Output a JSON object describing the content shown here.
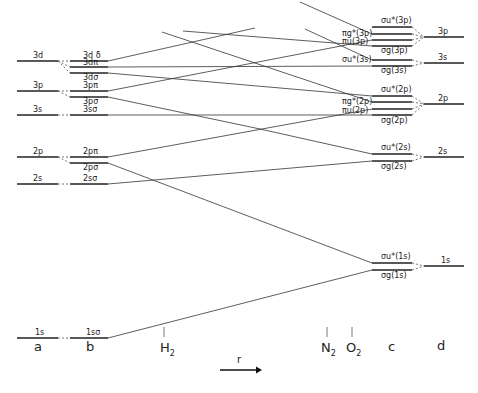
{
  "diagram": {
    "type": "molecular-orbital correlation diagram",
    "columns": {
      "a": "a",
      "b": "b",
      "c": "c",
      "d": "d"
    },
    "molecule_markers": {
      "h2": "H",
      "h2_sub": "2",
      "n2": "N",
      "n2_sub": "2",
      "o2": "O",
      "o2_sub": "2"
    },
    "axis": {
      "label": "r",
      "direction": "arrow-right-icon"
    },
    "column_a_levels": [
      "3d",
      "3p",
      "3s",
      "2p",
      "2s",
      "1s"
    ],
    "column_b_levels": [
      "3dδ",
      "3dπ",
      "3dσ",
      "3pπ",
      "3pσ",
      "3sσ",
      "2pπ",
      "2pσ",
      "2sσ",
      "1sσ"
    ],
    "column_c_levels": [
      "σu*(3p)",
      "πg*(3p)",
      "πu(3p)",
      "σg(3p)",
      "σu*(3s)",
      "σg(3s)",
      "σu*(2p)",
      "πg*(2p)",
      "πu(2p)",
      "σg(2p)",
      "σu*(2s)",
      "σg(2s)",
      "σu*(1s)",
      "σg(1s)"
    ],
    "column_d_levels": [
      "3p",
      "3s",
      "2p",
      "2s",
      "1s"
    ],
    "labels": {
      "a_3d": "3d",
      "a_3p": "3p",
      "a_3s": "3s",
      "a_2p": "2p",
      "a_2s": "2s",
      "a_1s": "1s",
      "b_3dd": "3d δ",
      "b_3dp": "3dπ",
      "b_3ds": "3dσ",
      "b_3pp": "3pπ",
      "b_3ps": "3pσ",
      "b_3ss": "3sσ",
      "b_2pp": "2pπ",
      "b_2ps": "2pσ",
      "b_2ss": "2sσ",
      "b_1ss": "1sσ",
      "c_su3p": "σu*(3p)",
      "c_pg3p": "πg*(3p)",
      "c_pu3p": "πu(3p)",
      "c_sg3p": "σg(3p)",
      "c_su3s": "σu*(3s)",
      "c_sg3s": "σg(3s)",
      "c_su2p": "σu*(2p)",
      "c_pg2p": "πg*(2p)",
      "c_pu2p": "πu(2p)",
      "c_sg2p": "σg(2p)",
      "c_su2s": "σu*(2s)",
      "c_sg2s": "σg(2s)",
      "c_su1s": "σu*(1s)",
      "c_sg1s": "σg(1s)",
      "d_3p": "3p",
      "d_3s": "3s",
      "d_2p": "2p",
      "d_2s": "2s",
      "d_1s": "1s"
    }
  }
}
